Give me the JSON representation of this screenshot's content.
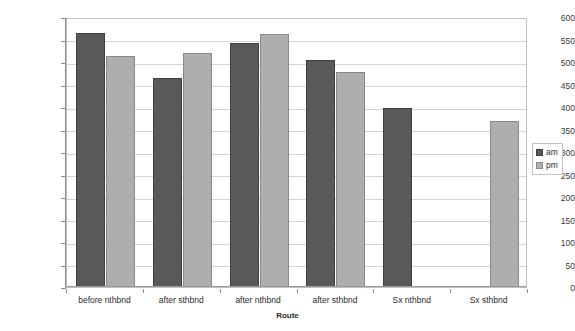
{
  "chart_data": {
    "type": "bar",
    "title": "",
    "xlabel": "Route",
    "ylabel": "Travel Time (sec)",
    "ylim": [
      0,
      600
    ],
    "ytick_step": 50,
    "yticks": [
      0,
      50,
      100,
      150,
      200,
      250,
      300,
      350,
      400,
      450,
      500,
      550,
      600
    ],
    "ytick_labels": [
      "0",
      "50",
      "100",
      "150",
      "200",
      "250",
      "300",
      "350",
      "400",
      "450",
      "500",
      "550",
      "600"
    ],
    "categories": [
      "before nthbnd",
      "after sthbnd",
      "after nthbnd",
      "after sthbnd",
      "Sx nthbnd",
      "Sx sthbnd"
    ],
    "grid": true,
    "legend_position": "right",
    "series": [
      {
        "name": "am",
        "color": "#595959",
        "values": [
          565,
          465,
          542,
          505,
          397,
          null
        ]
      },
      {
        "name": "pm",
        "color": "#aeaeae",
        "values": [
          514,
          521,
          562,
          478,
          null,
          368
        ]
      }
    ]
  },
  "legend": {
    "entries": [
      {
        "label": "am"
      },
      {
        "label": "pm"
      }
    ]
  },
  "axes": {
    "x_title": "Route",
    "y_title": "Travel Time (sec)"
  }
}
